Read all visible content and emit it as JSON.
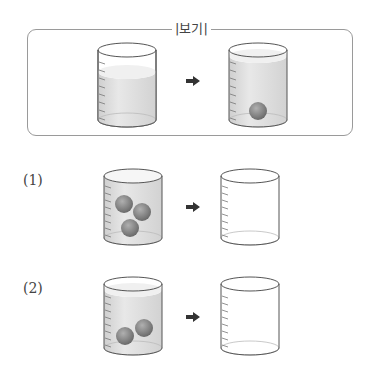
{
  "example_box": {
    "label": "|보기|",
    "before": {
      "water": "partial",
      "balls": 0
    },
    "after": {
      "water": "full",
      "balls": 1
    }
  },
  "problems": [
    {
      "label": "(1)",
      "before": {
        "water": "full",
        "balls": 3
      },
      "after": {
        "water": "empty",
        "balls": 0
      }
    },
    {
      "label": "(2)",
      "before": {
        "water": "full",
        "balls": 2
      },
      "after": {
        "water": "empty",
        "balls": 0
      }
    }
  ],
  "arrow_icon": "right-arrow-icon",
  "colors": {
    "water": "#dcdcdc",
    "ball": "#8a8a8a",
    "outline": "#555555",
    "box_border": "#9a9a9a"
  }
}
